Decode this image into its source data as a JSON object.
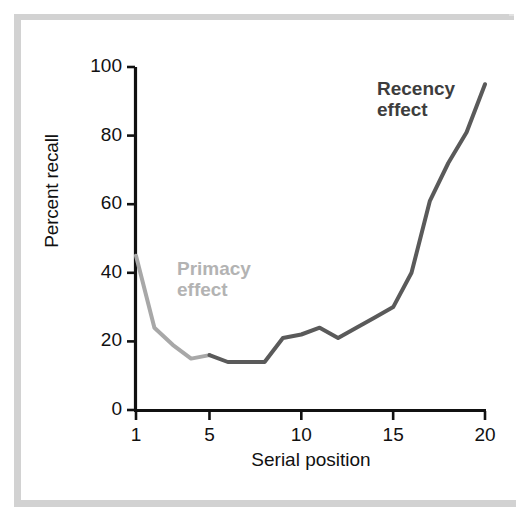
{
  "figure": {
    "background_color": "#ffffff",
    "frame_color": "#d2d2d2",
    "axis_color": "#111111"
  },
  "annotations": {
    "primacy": {
      "text": "Primacy\neffect",
      "color": "#b3b3b3"
    },
    "recency": {
      "text": "Recency\neffect",
      "color": "#3d3d3d"
    }
  },
  "chart_data": {
    "type": "line",
    "title": "",
    "xlabel": "Serial position",
    "ylabel": "Percent recall",
    "xlim": [
      1,
      20
    ],
    "ylim": [
      0,
      100
    ],
    "xticks": [
      1,
      5,
      10,
      15,
      20
    ],
    "xtick_labels": [
      "1",
      "5",
      "10",
      "15",
      "20"
    ],
    "yticks": [
      0,
      20,
      40,
      60,
      80,
      100
    ],
    "ytick_labels": [
      "0",
      "20",
      "40",
      "60",
      "80",
      "100"
    ],
    "grid": false,
    "legend": "none",
    "x": [
      1,
      2,
      3,
      4,
      5,
      6,
      7,
      8,
      9,
      10,
      11,
      12,
      13,
      14,
      15,
      16,
      17,
      18,
      19,
      20
    ],
    "series": [
      {
        "name": "Percent recall",
        "values": [
          45,
          24,
          19,
          15,
          16,
          14,
          14,
          14,
          21,
          22,
          24,
          21,
          24,
          27,
          30,
          40,
          61,
          72,
          81,
          95
        ],
        "segment_colors": {
          "primacy_color": "#a8a8a8",
          "primacy_range": [
            1,
            5
          ],
          "recency_color": "#5a5a5a",
          "recency_range": [
            5,
            20
          ]
        },
        "line_width": 4
      }
    ],
    "annotations": [
      {
        "label": "Primacy effect",
        "x": 4,
        "y": 43,
        "color": "#b3b3b3"
      },
      {
        "label": "Recency effect",
        "x": 16,
        "y": 90,
        "color": "#3d3d3d"
      }
    ]
  }
}
